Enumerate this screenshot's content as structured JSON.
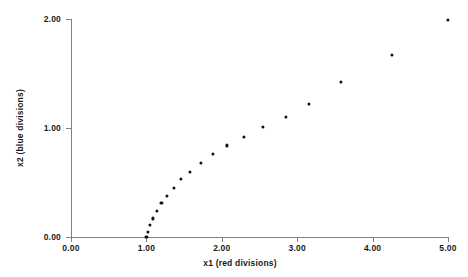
{
  "chart_data": {
    "type": "scatter",
    "title": "",
    "xlabel": "x1 (red divisions)",
    "ylabel": "x2 (blue divisions)",
    "xlim": [
      0.0,
      5.0
    ],
    "ylim": [
      0.0,
      2.0
    ],
    "xticks": [
      0.0,
      1.0,
      2.0,
      3.0,
      4.0,
      5.0
    ],
    "yticks": [
      0.0,
      1.0,
      2.0
    ],
    "xticklabels": [
      "0.00",
      "1.00",
      "2.00",
      "3.00",
      "4.00",
      "5.00"
    ],
    "yticklabels": [
      "0.00",
      "1.00",
      "2.00"
    ],
    "grid": false,
    "legend": false,
    "marker": "filled-circle",
    "marker_color": "#111111",
    "axis_color": "#808080",
    "background": "#ffffff",
    "series": [
      {
        "name": "data",
        "points": [
          [
            1.0,
            0.0
          ],
          [
            1.02,
            0.05
          ],
          [
            1.05,
            0.11
          ],
          [
            1.09,
            0.17
          ],
          [
            1.14,
            0.24
          ],
          [
            1.2,
            0.31
          ],
          [
            1.27,
            0.38
          ],
          [
            1.36,
            0.45
          ],
          [
            1.46,
            0.53
          ],
          [
            1.58,
            0.6
          ],
          [
            1.72,
            0.68
          ],
          [
            1.88,
            0.76
          ],
          [
            2.07,
            0.84
          ],
          [
            2.29,
            0.92
          ],
          [
            2.55,
            1.01
          ],
          [
            2.85,
            1.1
          ],
          [
            3.15,
            1.22
          ],
          [
            3.58,
            1.42
          ],
          [
            4.26,
            1.67
          ],
          [
            5.0,
            1.99
          ]
        ]
      }
    ]
  }
}
